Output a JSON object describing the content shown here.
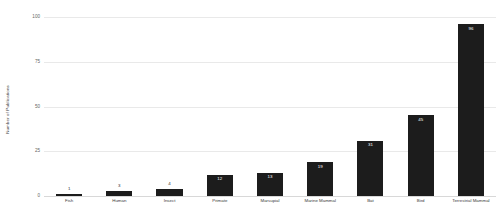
{
  "chart_data": {
    "type": "bar",
    "title": "",
    "xlabel": "",
    "ylabel": "Number of Publications",
    "categories": [
      "Fish",
      "Human",
      "Insect",
      "Primate",
      "Marsupial",
      "Marine Mammal",
      "Bat",
      "Bird",
      "Terrestrial Mammal"
    ],
    "values": [
      1,
      3,
      4,
      12,
      13,
      19,
      31,
      45,
      96
    ],
    "value_labels": [
      "1",
      "3",
      "4",
      "12",
      "13",
      "19",
      "31",
      "45",
      "96"
    ],
    "ylim": [
      0,
      100
    ],
    "yticks": [
      100,
      75,
      50,
      25,
      0
    ],
    "ytick_labels": [
      "100",
      "75",
      "50",
      "25",
      "0"
    ],
    "grid": true,
    "legend": "none",
    "bar_color": "#1c1c1c",
    "gridline_color": "#e9e9e9",
    "background_color": "#ffffff"
  }
}
